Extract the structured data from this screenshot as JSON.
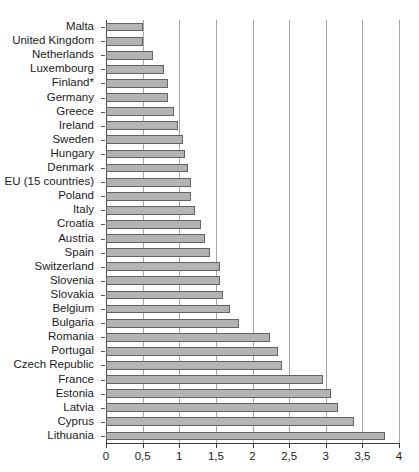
{
  "chart_data": {
    "type": "bar",
    "orientation": "horizontal",
    "title": "",
    "subtitle": "",
    "xlabel": "",
    "ylabel": "",
    "xlim": [
      0,
      4
    ],
    "ylim": null,
    "grid": true,
    "grid_axis": "x",
    "legend": false,
    "legend_position": "none",
    "decimal_separator": ",",
    "bar_color": "#b3b3b3",
    "bar_edge_color": "#636363",
    "axis_color": "#3c3c3c",
    "grid_color": "#a8a8a8",
    "text_color": "#1c1c1c",
    "background_color": "#ffffff",
    "xticks": [
      0,
      0.5,
      1,
      1.5,
      2,
      2.5,
      3,
      3.5,
      4
    ],
    "xtick_labels": [
      "0",
      "0,5",
      "1",
      "1,5",
      "2",
      "2,5",
      "3",
      "3,5",
      "4"
    ],
    "categories": [
      "Malta",
      "United Kingdom",
      "Netherlands",
      "Luxembourg",
      "Finland*",
      "Germany",
      "Greece",
      "Ireland",
      "Sweden",
      "Hungary",
      "Denmark",
      "EU (15 countries)",
      "Poland",
      "Italy",
      "Croatia",
      "Austria",
      "Spain",
      "Switzerland",
      "Slovenia",
      "Slovakia",
      "Belgium",
      "Bulgaria",
      "Romania",
      "Portugal",
      "Czech Republic",
      "France",
      "Estonia",
      "Latvia",
      "Cyprus",
      "Lithuania"
    ],
    "values": [
      0.5,
      0.5,
      0.64,
      0.79,
      0.84,
      0.85,
      0.93,
      0.98,
      1.05,
      1.08,
      1.12,
      1.16,
      1.16,
      1.22,
      1.3,
      1.35,
      1.42,
      1.55,
      1.56,
      1.6,
      1.69,
      1.82,
      2.24,
      2.35,
      2.4,
      2.96,
      3.07,
      3.17,
      3.39,
      3.81
    ]
  }
}
